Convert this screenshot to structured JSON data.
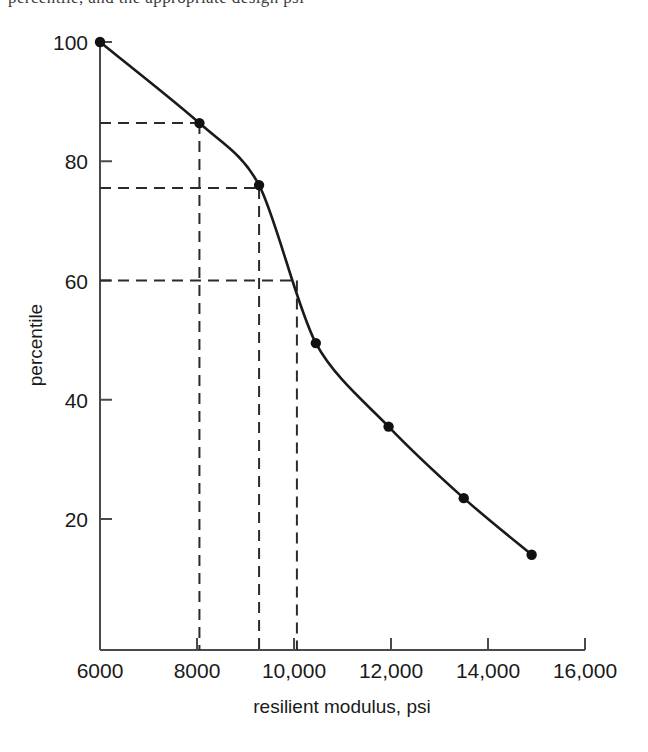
{
  "figure": {
    "top_text_fragment": "percentile, and the appropriate design psi",
    "background_color": "#ffffff",
    "line_color": "#1a1a1a",
    "marker_color": "#111111",
    "dash_color": "#2b2b2b",
    "axis_color": "#4a4a4a"
  },
  "chart_data": {
    "type": "line",
    "title": "",
    "subtitle": "",
    "xlabel": "resilient modulus, psi",
    "ylabel": "percentile",
    "xlim": [
      6000,
      16000
    ],
    "ylim": [
      0,
      100
    ],
    "xticks": [
      6000,
      8000,
      10000,
      12000,
      14000,
      16000
    ],
    "xticklabels": [
      "6000",
      "8000",
      "10,000",
      "12,000",
      "14,000",
      "16,000"
    ],
    "yticks": [
      20,
      40,
      60,
      80,
      100
    ],
    "yticklabels": [
      "20",
      "40",
      "60",
      "80",
      "100"
    ],
    "grid": false,
    "legend": false,
    "legend_position": "none",
    "series": [
      {
        "name": "percentile curve",
        "markers": true,
        "x": [
          6000,
          8050,
          9280,
          10450,
          11950,
          13500,
          14900
        ],
        "y": [
          100.0,
          86.4,
          76.0,
          49.5,
          35.5,
          23.5,
          14.0
        ]
      }
    ],
    "annotations": [
      {
        "name": "guide-86",
        "style": "dashed-crosshair",
        "x": 8050,
        "y": 86.4,
        "label": ""
      },
      {
        "name": "guide-76",
        "style": "dashed-crosshair",
        "x": 9280,
        "y": 75.5,
        "label": ""
      },
      {
        "name": "guide-60",
        "style": "dashed-crosshair",
        "x": 10060,
        "y": 60.0,
        "label": ""
      }
    ]
  }
}
